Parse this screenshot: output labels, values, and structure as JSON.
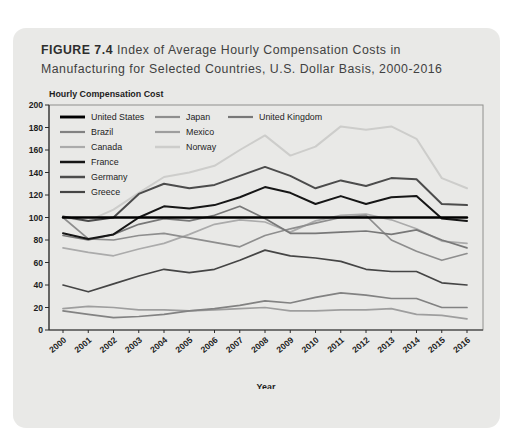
{
  "figure": {
    "label": "FIGURE 7.4",
    "title_line1_rest": " Index of Average Hourly Compensation Costs in",
    "title_line2": "Manufacturing for Selected Countries, U.S. Dollar Basis, 2000-2016",
    "card_background": "#e9e9e7"
  },
  "chart_data": {
    "type": "line",
    "title": "Index of Average Hourly Compensation Costs in Manufacturing for Selected Countries, U.S. Dollar Basis, 2000-2016",
    "ylabel": "Hourly Compensation Cost",
    "xlabel": "Year",
    "ylim": [
      0,
      200
    ],
    "ytick_step": 20,
    "grid": false,
    "legend_position": "top-left-inside",
    "x": [
      "2000",
      "2001",
      "2002",
      "2003",
      "2004",
      "2005",
      "2006",
      "2007",
      "2008",
      "2009",
      "2010",
      "2011",
      "2012",
      "2013",
      "2014",
      "2015",
      "2016"
    ],
    "series": [
      {
        "name": "United States",
        "color": "#000000",
        "width": 2.4,
        "values": [
          100,
          100,
          100,
          100,
          100,
          100,
          100,
          100,
          100,
          100,
          100,
          100,
          100,
          100,
          100,
          100,
          100
        ]
      },
      {
        "name": "Brazil",
        "color": "#828282",
        "width": 1.7,
        "values": [
          17,
          14,
          11,
          12,
          14,
          17,
          19,
          22,
          26,
          24,
          29,
          33,
          31,
          28,
          28,
          20,
          20
        ]
      },
      {
        "name": "Canada",
        "color": "#ababab",
        "width": 1.7,
        "values": [
          73,
          69,
          66,
          72,
          77,
          85,
          94,
          98,
          96,
          87,
          97,
          102,
          103,
          98,
          90,
          79,
          77
        ]
      },
      {
        "name": "France",
        "color": "#161616",
        "width": 2.0,
        "values": [
          86,
          81,
          85,
          100,
          110,
          108,
          111,
          118,
          127,
          122,
          112,
          119,
          112,
          118,
          119,
          99,
          97
        ]
      },
      {
        "name": "Germany",
        "color": "#4c4c4c",
        "width": 2.0,
        "values": [
          101,
          97,
          100,
          121,
          130,
          126,
          129,
          137,
          145,
          137,
          126,
          133,
          128,
          135,
          134,
          112,
          111
        ]
      },
      {
        "name": "Greece",
        "color": "#454545",
        "width": 1.7,
        "values": [
          40,
          34,
          41,
          48,
          54,
          51,
          54,
          62,
          71,
          66,
          64,
          61,
          54,
          52,
          52,
          42,
          40
        ]
      },
      {
        "name": "Japan",
        "color": "#8e8e8e",
        "width": 1.7,
        "values": [
          100,
          81,
          80,
          84,
          86,
          82,
          78,
          74,
          84,
          90,
          95,
          100,
          102,
          80,
          70,
          62,
          68
        ]
      },
      {
        "name": "Mexico",
        "color": "#9e9e9e",
        "width": 1.7,
        "values": [
          19,
          21,
          20,
          18,
          18,
          17,
          18,
          19,
          20,
          17,
          17,
          18,
          18,
          19,
          14,
          13,
          10
        ]
      },
      {
        "name": "Norway",
        "color": "#cdcdcb",
        "width": 2.0,
        "values": [
          100,
          97,
          107,
          122,
          136,
          140,
          146,
          160,
          173,
          155,
          163,
          181,
          178,
          181,
          170,
          135,
          126
        ]
      },
      {
        "name": "United Kingdom",
        "color": "#787878",
        "width": 1.7,
        "values": [
          84,
          80,
          85,
          94,
          99,
          97,
          102,
          110,
          99,
          86,
          86,
          87,
          88,
          85,
          89,
          80,
          73
        ]
      }
    ],
    "legend_columns": [
      [
        0,
        1,
        2,
        3,
        4,
        5
      ],
      [
        6,
        7,
        8
      ],
      [
        9
      ]
    ],
    "draw_order": [
      "Norway",
      "Canada",
      "Mexico",
      "Japan",
      "United Kingdom",
      "Brazil",
      "Greece",
      "Germany",
      "France",
      "United States"
    ]
  }
}
